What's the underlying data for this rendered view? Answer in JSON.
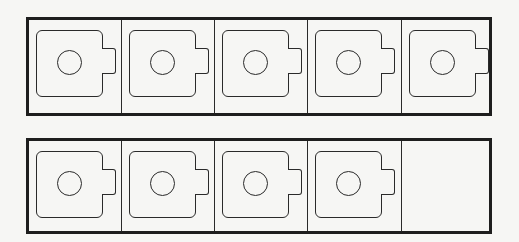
{
  "colors": {
    "background": "#f6f6f4",
    "stroke": "#1e1e1e"
  },
  "rows": [
    {
      "name": "row-1",
      "cells": [
        {
          "filled": true,
          "icon": "mug-icon"
        },
        {
          "filled": true,
          "icon": "mug-icon"
        },
        {
          "filled": true,
          "icon": "mug-icon"
        },
        {
          "filled": true,
          "icon": "mug-icon"
        },
        {
          "filled": true,
          "icon": "mug-icon"
        }
      ]
    },
    {
      "name": "row-2",
      "cells": [
        {
          "filled": true,
          "icon": "mug-icon"
        },
        {
          "filled": true,
          "icon": "mug-icon"
        },
        {
          "filled": true,
          "icon": "mug-icon"
        },
        {
          "filled": true,
          "icon": "mug-icon"
        },
        {
          "filled": false,
          "icon": ""
        }
      ]
    }
  ],
  "summary": {
    "frames": 2,
    "cells_per_frame": 5,
    "filled_total": 9,
    "empty_total": 1
  },
  "edge_mark": ""
}
